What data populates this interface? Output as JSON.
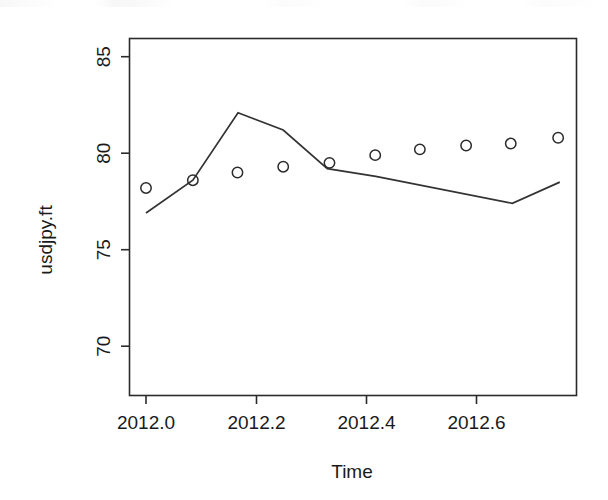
{
  "chart_data": {
    "type": "line",
    "title": "",
    "xlabel": "Time",
    "ylabel": "usdjpy.ft",
    "xlim": [
      2011.975,
      2012.785
    ],
    "ylim": [
      69.4,
      86.5
    ],
    "grid": false,
    "legend": "none",
    "xticks": [
      2012.0,
      2012.2,
      2012.4,
      2012.6
    ],
    "xtick_labels": [
      "2012.0",
      "2012.2",
      "2012.4",
      "2012.6"
    ],
    "yticks": [
      70,
      75,
      80,
      85
    ],
    "ytick_labels": [
      "70",
      "75",
      "80",
      "85"
    ],
    "series": [
      {
        "name": "forecast-line",
        "marker": "none",
        "style": "solid",
        "x": [
          2012.0,
          2012.085,
          2012.167,
          2012.249,
          2012.329,
          2012.417,
          2012.665,
          2012.751
        ],
        "values": [
          76.9,
          78.6,
          82.1,
          81.2,
          79.2,
          78.8,
          77.4,
          78.5
        ]
      },
      {
        "name": "observed-points",
        "marker": "open-circle",
        "style": "none",
        "x": [
          2012.0,
          2012.085,
          2012.166,
          2012.249,
          2012.333,
          2012.416,
          2012.497,
          2012.581,
          2012.662,
          2012.748
        ],
        "values": [
          78.2,
          78.6,
          79.0,
          79.3,
          79.5,
          79.9,
          80.2,
          80.4,
          80.5,
          80.8
        ]
      }
    ]
  },
  "axes": {
    "y_title": "usdjpy.ft",
    "x_title": "Time"
  }
}
